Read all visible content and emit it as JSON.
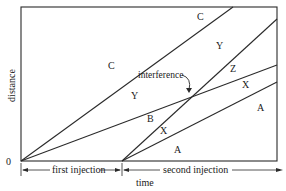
{
  "diagram": {
    "type": "distance-time diagram",
    "axes": {
      "y_label": "distance",
      "x_label": "time",
      "origin_label": "0"
    },
    "intervals": [
      {
        "label": "first injection"
      },
      {
        "label": "second injection"
      }
    ],
    "annotation": {
      "label": "interference"
    },
    "regions": [
      {
        "id": "C-upper",
        "label": "C"
      },
      {
        "id": "C-left",
        "label": "C"
      },
      {
        "id": "Y-upper",
        "label": "Y"
      },
      {
        "id": "Y-left",
        "label": "Y"
      },
      {
        "id": "Z",
        "label": "Z"
      },
      {
        "id": "X-right",
        "label": "X"
      },
      {
        "id": "B",
        "label": "B"
      },
      {
        "id": "X-lower",
        "label": "X"
      },
      {
        "id": "A-right",
        "label": "A"
      },
      {
        "id": "A-lower",
        "label": "A"
      }
    ],
    "colors": {
      "line": "#2a2a2a",
      "background": "#ffffff"
    }
  }
}
